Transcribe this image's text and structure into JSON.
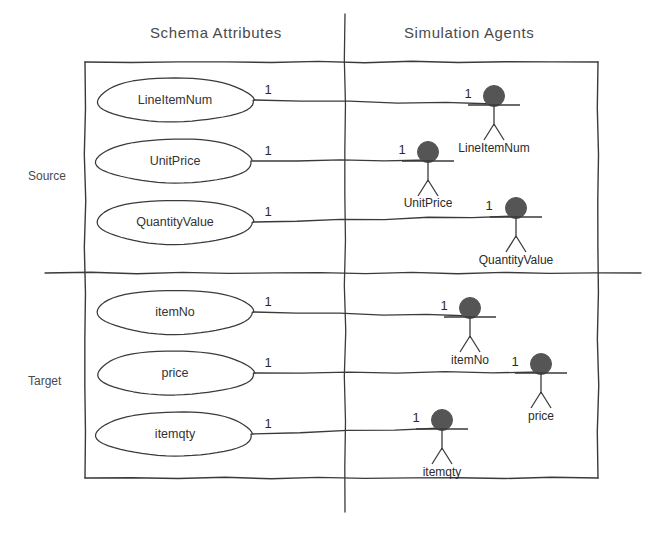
{
  "diagram": {
    "colors": {
      "line": "#3a3a3a",
      "actor_head": "#555555",
      "text": "#333333",
      "background": "#ffffff"
    },
    "headers": [
      {
        "label": "Schema Attributes",
        "x": 230,
        "y": 32
      },
      {
        "label": "Simulation Agents",
        "x": 475,
        "y": 32
      }
    ],
    "sections": [
      {
        "label": "Source",
        "x": 30,
        "y": 175
      },
      {
        "label": "Target",
        "x": 30,
        "y": 380
      }
    ],
    "frame": {
      "x": 85,
      "y": 62,
      "width": 513,
      "height": 416
    },
    "divider_horizontal": {
      "x1": 45,
      "y1": 273,
      "x2": 641,
      "y2": 273
    },
    "divider_vertical": {
      "x1": 345,
      "y1": 14,
      "x2": 345,
      "y2": 512
    },
    "attributes": [
      {
        "name": "LineItemNum",
        "cx": 175,
        "cy": 100,
        "rx": 78,
        "ry": 22,
        "multiplicity": "1"
      },
      {
        "name": "UnitPrice",
        "cx": 175,
        "cy": 161,
        "rx": 78,
        "ry": 22,
        "multiplicity": "1"
      },
      {
        "name": "QuantityValue",
        "cx": 175,
        "cy": 222,
        "rx": 78,
        "ry": 22,
        "multiplicity": "1"
      },
      {
        "name": "itemNo",
        "cx": 175,
        "cy": 312,
        "rx": 78,
        "ry": 22,
        "multiplicity": "1"
      },
      {
        "name": "price",
        "cx": 175,
        "cy": 373,
        "rx": 78,
        "ry": 22,
        "multiplicity": "1"
      },
      {
        "name": "itemqty",
        "cx": 175,
        "cy": 434,
        "rx": 78,
        "ry": 22,
        "multiplicity": "1"
      }
    ],
    "agents": [
      {
        "name": "LineItemNum",
        "x": 494,
        "y": 96,
        "multiplicity": "1",
        "label_y": 141
      },
      {
        "name": "UnitPrice",
        "x": 428,
        "y": 152,
        "multiplicity": "1",
        "label_y": 196
      },
      {
        "name": "QuantityValue",
        "x": 516,
        "y": 208,
        "multiplicity": "1",
        "label_y": 253
      },
      {
        "name": "itemNo",
        "x": 470,
        "y": 308,
        "multiplicity": "1",
        "label_y": 353
      },
      {
        "name": "price",
        "x": 541,
        "y": 364,
        "multiplicity": "1",
        "label_y": 409
      },
      {
        "name": "itemqty",
        "x": 442,
        "y": 420,
        "multiplicity": "1",
        "label_y": 465
      }
    ],
    "connections": [
      {
        "from": "LineItemNum",
        "to": "LineItemNum",
        "x1": 253,
        "y1": 100,
        "x2": 494,
        "y2": 104
      },
      {
        "from": "UnitPrice",
        "to": "UnitPrice",
        "x1": 253,
        "y1": 161,
        "x2": 428,
        "y2": 160
      },
      {
        "from": "QuantityValue",
        "to": "QuantityValue",
        "x1": 253,
        "y1": 222,
        "x2": 516,
        "y2": 216
      },
      {
        "from": "itemNo",
        "to": "itemNo",
        "x1": 253,
        "y1": 312,
        "x2": 470,
        "y2": 316
      },
      {
        "from": "price",
        "to": "price",
        "x1": 253,
        "y1": 373,
        "x2": 541,
        "y2": 372
      },
      {
        "from": "itemqty",
        "to": "itemqty",
        "x1": 253,
        "y1": 434,
        "x2": 442,
        "y2": 428
      }
    ],
    "source_multiplicities": [
      {
        "value": "1",
        "x": 268,
        "y": 89
      },
      {
        "value": "1",
        "x": 268,
        "y": 150
      },
      {
        "value": "1",
        "x": 268,
        "y": 211
      },
      {
        "value": "1",
        "x": 268,
        "y": 301
      },
      {
        "value": "1",
        "x": 268,
        "y": 362
      },
      {
        "value": "1",
        "x": 268,
        "y": 423
      }
    ],
    "target_multiplicities": [
      {
        "value": "1",
        "x": 468,
        "y": 93
      },
      {
        "value": "1",
        "x": 402,
        "y": 149
      },
      {
        "value": "1",
        "x": 489,
        "y": 205
      },
      {
        "value": "1",
        "x": 444,
        "y": 305
      },
      {
        "value": "1",
        "x": 515,
        "y": 361
      },
      {
        "value": "1",
        "x": 416,
        "y": 417
      }
    ]
  }
}
